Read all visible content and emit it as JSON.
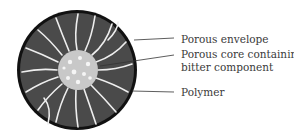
{
  "diagram": {
    "labels": {
      "envelope": "Porous envelope",
      "core_line1": "Porous core containing",
      "core_line2": "bitter component",
      "polymer": "Polymer"
    },
    "colors": {
      "matrix": "#4a4a4a",
      "rim": "#111111",
      "core": "#c8c8c8",
      "strands": "#f2f2f2",
      "leader": "#333333"
    }
  }
}
